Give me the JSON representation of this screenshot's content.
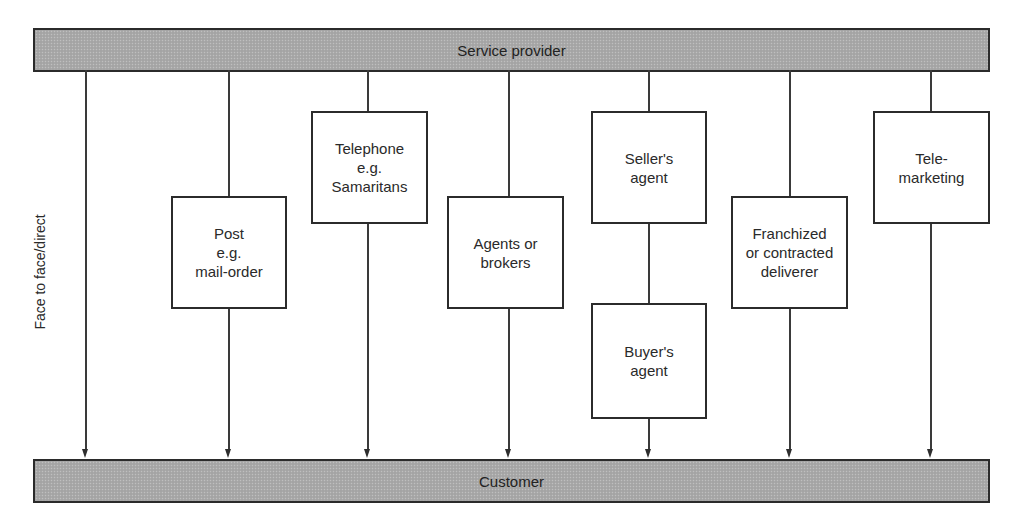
{
  "diagram": {
    "top_bar": {
      "label": "Service provider"
    },
    "bottom_bar": {
      "label": "Customer"
    },
    "side_label": "Face to face/direct",
    "channels": [
      {
        "id": "direct",
        "label": "Face to face/direct",
        "boxes": []
      },
      {
        "id": "post",
        "boxes": [
          {
            "label": "Post\ne.g.\nmail-order"
          }
        ]
      },
      {
        "id": "telephone",
        "boxes": [
          {
            "label": "Telephone\ne.g.\nSamaritans"
          }
        ]
      },
      {
        "id": "agents",
        "boxes": [
          {
            "label": "Agents or\nbrokers"
          }
        ]
      },
      {
        "id": "agent-chain",
        "boxes": [
          {
            "label": "Seller's\nagent"
          },
          {
            "label": "Buyer's\nagent"
          }
        ]
      },
      {
        "id": "franchise",
        "boxes": [
          {
            "label": "Franchized\nor contracted\ndeliverer"
          }
        ]
      },
      {
        "id": "telemarketing",
        "boxes": [
          {
            "label": "Tele-\nmarketing"
          }
        ]
      }
    ],
    "colors": {
      "bar_fill": "#a9a9a9",
      "stroke": "#2b2b2b",
      "background": "#ffffff"
    }
  }
}
